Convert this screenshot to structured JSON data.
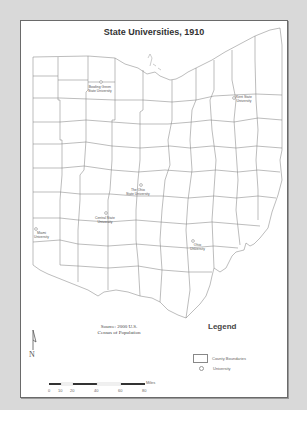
{
  "map": {
    "title": "State Universities, 1910",
    "source_line1": "Source: 2000 U.S.",
    "source_line2": "Census of Population",
    "universities": [
      {
        "name_line1": "Bowling Green",
        "name_line2": "State University"
      },
      {
        "name_line1": "Kent State",
        "name_line2": "University"
      },
      {
        "name_line1": "The Ohio",
        "name_line2": "State University"
      },
      {
        "name_line1": "Central State",
        "name_line2": "University"
      },
      {
        "name_line1": "Miami",
        "name_line2": "University"
      },
      {
        "name_line1": "Ohio",
        "name_line2": "University"
      }
    ]
  },
  "legend": {
    "title": "Legend",
    "items": [
      {
        "label": "County Boundaries",
        "symbol": "rectangle"
      },
      {
        "label": "University",
        "symbol": "circle"
      }
    ]
  },
  "scale_bar": {
    "ticks": [
      "0",
      "10",
      "20",
      "40",
      "60",
      "80"
    ],
    "unit": "Miles"
  },
  "north_arrow": {
    "label": "N"
  },
  "colors": {
    "background": "#d9d9d9",
    "frame_border": "#6a6a6a",
    "county_line": "#7a7a7a"
  }
}
